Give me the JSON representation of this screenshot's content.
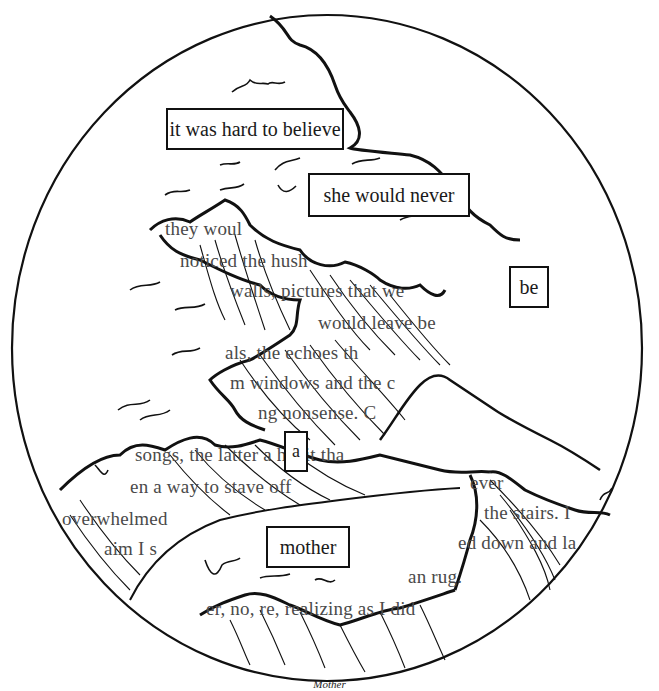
{
  "artwork": {
    "caption": "Mother",
    "highlighted_words": [
      {
        "text": "it was hard to believe"
      },
      {
        "text": "she would never"
      },
      {
        "text": "be"
      },
      {
        "text": "a"
      },
      {
        "text": "mother"
      }
    ],
    "background_text_lines": [
      "they woul",
      "noticed the hush",
      "walls, pictures that we",
      "would leave be",
      "als, the echoes th",
      "m windows and the c",
      "ng nonsense. C",
      "songs, the latter a habit tha",
      "en a way to stave off",
      "ever",
      "overwhelmed",
      "the stairs. I",
      "aim I s",
      "ed down and la",
      "an rug.",
      "er, no, re, realizing as I did"
    ],
    "colors": {
      "ink": "#111111",
      "paper": "#ffffff",
      "faded_text": "#4a4a4a"
    }
  }
}
